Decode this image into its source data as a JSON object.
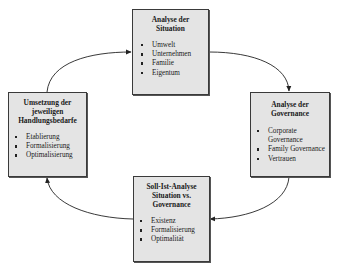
{
  "diagram": {
    "type": "cycle",
    "boxes": {
      "top": {
        "title": "Analyse der Situation",
        "title_lines": [
          "Analyse der",
          "Situation"
        ],
        "items": [
          "Umwelt",
          "Unternehmen",
          "Familie",
          "Eigentum"
        ]
      },
      "right": {
        "title": "Analyse der Governance",
        "title_lines": [
          "Analyse der",
          "Governance"
        ],
        "items": [
          "Corporate Governance",
          "Family Governance",
          "Vertrauen"
        ]
      },
      "bottom": {
        "title": "Soll-Ist-Analyse Situation vs. Governance",
        "title_lines": [
          "Soll-Ist-Analyse",
          "Situation vs.",
          "Governance"
        ],
        "items": [
          "Existenz",
          "Formalisierung",
          "Optimalität"
        ]
      },
      "left": {
        "title": "Umsetzung der jeweiligen Handlungsbedarfe",
        "title_lines": [
          "Umsetzung der",
          "jeweiligen",
          "Handlungsbedarfe"
        ],
        "items": [
          "Etablierung",
          "Formalisierung",
          "Optimalisierung"
        ]
      }
    },
    "arrows": [
      {
        "from": "left",
        "to": "top"
      },
      {
        "from": "top",
        "to": "right"
      },
      {
        "from": "right",
        "to": "bottom"
      },
      {
        "from": "bottom",
        "to": "left"
      }
    ],
    "colors": {
      "box_fill": "#e4e4e4",
      "box_border": "#3a3a3a",
      "arrow": "#222222"
    }
  }
}
